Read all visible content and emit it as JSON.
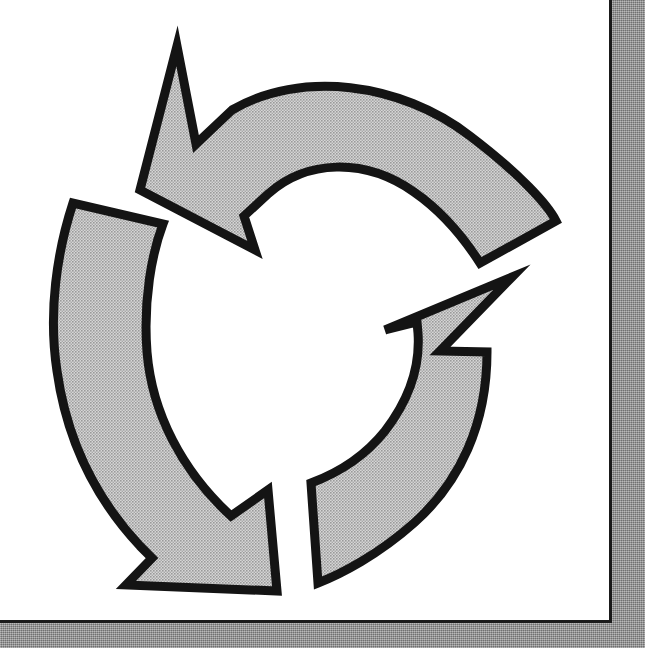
{
  "page": {
    "kind": "scanned-page",
    "background_color": "#ffffff",
    "border_color": "#1a1a1a",
    "shadow_band_color": "#8a8a8a",
    "width": 645,
    "height": 648
  },
  "diagram": {
    "name": "three-arrow-cycle-diagram",
    "title": "",
    "arrow_fill_color": "#b8b8b8",
    "arrow_outline_color": "#141414",
    "fill_style": "halftone-dither",
    "direction": "counterclockwise",
    "arrow_count": 3,
    "center": {
      "x": 320,
      "y": 330
    },
    "arrows": [
      {
        "id": "arrow-top",
        "label": "",
        "position": "top",
        "head_direction": "up-left",
        "head_tip": {
          "x": 177,
          "y": 46
        },
        "tail_end": {
          "x": 533,
          "y": 222
        },
        "arc_start_deg": 200,
        "arc_end_deg": 330
      },
      {
        "id": "arrow-right",
        "label": "",
        "position": "right",
        "head_direction": "up-right",
        "head_tip": {
          "x": 510,
          "y": 276
        },
        "tail_end": {
          "x": 315,
          "y": 612
        },
        "arc_start_deg": 75,
        "arc_end_deg": 210
      },
      {
        "id": "arrow-bottom-left",
        "label": "",
        "position": "left",
        "head_direction": "down-right",
        "head_tip": {
          "x": 277,
          "y": 592
        },
        "tail_end": {
          "x": 73,
          "y": 203
        },
        "arc_start_deg": 320,
        "arc_end_deg": 85
      }
    ]
  }
}
